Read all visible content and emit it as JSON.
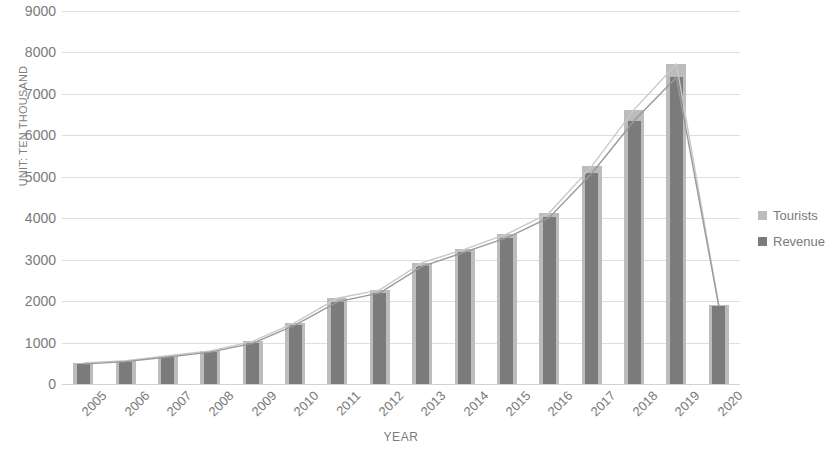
{
  "chart_data": {
    "type": "bar",
    "title": "",
    "xlabel": "YEAR",
    "ylabel": "UNIT: TEN THOUSAND",
    "ylim": [
      0,
      9000
    ],
    "ytick_step": 1000,
    "yticks": [
      "9000",
      "8000",
      "7000",
      "6000",
      "5000",
      "4000",
      "3000",
      "2000",
      "1000",
      "0"
    ],
    "grid": true,
    "legend_position": "right",
    "categories": [
      "2005",
      "2006",
      "2007",
      "2008",
      "2009",
      "2010",
      "2011",
      "2012",
      "2013",
      "2014",
      "2015",
      "2016",
      "2017",
      "2018",
      "2019",
      "2020"
    ],
    "series": [
      {
        "name": "Tourists",
        "color": "#bcbcbc",
        "values": [
          510,
          560,
          680,
          800,
          1030,
          1480,
          2070,
          2270,
          2930,
          3250,
          3620,
          4130,
          5250,
          6620,
          7720,
          1900
        ]
      },
      {
        "name": "Revenue",
        "color": "#7b7b7b",
        "values": [
          480,
          540,
          650,
          770,
          980,
          1420,
          1980,
          2200,
          2840,
          3180,
          3530,
          4020,
          5080,
          6350,
          7400,
          1880
        ]
      }
    ]
  },
  "legend": {
    "items": [
      {
        "label": "Tourists",
        "color": "#bcbcbc"
      },
      {
        "label": "Revenue",
        "color": "#7b7b7b"
      }
    ]
  },
  "axes": {
    "y_title": "UNIT: TEN THOUSAND",
    "x_title": "YEAR"
  }
}
